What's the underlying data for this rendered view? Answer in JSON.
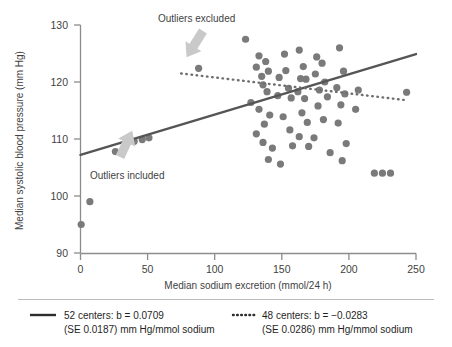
{
  "chart_data": {
    "type": "scatter",
    "title": "",
    "xlabel": "Median sodium excretion (mmol/24 h)",
    "ylabel": "Median systolic blood pressure (mm Hg)",
    "xlim": [
      0,
      250
    ],
    "ylim": [
      90,
      130
    ],
    "xticks": [
      0,
      50,
      100,
      150,
      200,
      250
    ],
    "yticks": [
      90,
      100,
      110,
      120,
      130
    ],
    "xtick_labels": [
      "0",
      "50",
      "100",
      "150",
      "200",
      "250"
    ],
    "ytick_labels": [
      "90",
      "100",
      "110",
      "120",
      "130"
    ],
    "grid": false,
    "legend_position": "below-plot",
    "point_color": "#7a7a7a",
    "annotations": [
      {
        "name": "outliers-excluded",
        "text": "Outliers excluded",
        "x": 100,
        "y": 129.4,
        "arrow_to_x": 88,
        "arrow_to_y": 121.8
      },
      {
        "name": "outliers-included",
        "text": "Outliers included",
        "x": 55,
        "y": 102.6,
        "arrow_to_x": 40,
        "arrow_to_y": 109.2
      }
    ],
    "points": [
      [
        0.5,
        95.0
      ],
      [
        7.0,
        99.0
      ],
      [
        26.0,
        107.8
      ],
      [
        40.0,
        109.6
      ],
      [
        46.0,
        109.9
      ],
      [
        51.0,
        110.2
      ],
      [
        88.0,
        122.4
      ],
      [
        123.0,
        127.5
      ],
      [
        133.0,
        124.6
      ],
      [
        131.0,
        122.6
      ],
      [
        135.0,
        121.0
      ],
      [
        138.0,
        123.6
      ],
      [
        140.0,
        121.9
      ],
      [
        136.0,
        119.5
      ],
      [
        139.0,
        118.3
      ],
      [
        127.0,
        116.4
      ],
      [
        133.0,
        115.2
      ],
      [
        141.0,
        114.2
      ],
      [
        137.0,
        112.6
      ],
      [
        131.0,
        110.9
      ],
      [
        136.0,
        109.4
      ],
      [
        143.0,
        108.4
      ],
      [
        140.0,
        106.4
      ],
      [
        147.0,
        117.6
      ],
      [
        148.0,
        120.8
      ],
      [
        152.0,
        124.9
      ],
      [
        153.0,
        122.0
      ],
      [
        155.0,
        118.9
      ],
      [
        157.0,
        117.2
      ],
      [
        151.0,
        113.9
      ],
      [
        156.0,
        111.6
      ],
      [
        158.0,
        108.8
      ],
      [
        149.0,
        105.6
      ],
      [
        163.0,
        125.6
      ],
      [
        166.0,
        122.7
      ],
      [
        164.0,
        120.6
      ],
      [
        168.0,
        120.5
      ],
      [
        162.0,
        118.3
      ],
      [
        167.0,
        117.1
      ],
      [
        165.0,
        114.6
      ],
      [
        169.0,
        112.9
      ],
      [
        163.0,
        110.4
      ],
      [
        170.0,
        108.7
      ],
      [
        176.0,
        124.4
      ],
      [
        180.0,
        123.3
      ],
      [
        175.0,
        121.4
      ],
      [
        182.0,
        120.0
      ],
      [
        178.0,
        118.6
      ],
      [
        184.0,
        117.4
      ],
      [
        177.0,
        115.8
      ],
      [
        181.0,
        113.4
      ],
      [
        174.0,
        110.2
      ],
      [
        186.0,
        107.6
      ],
      [
        193.0,
        126.0
      ],
      [
        196.0,
        121.9
      ],
      [
        191.0,
        119.0
      ],
      [
        197.0,
        117.9
      ],
      [
        194.0,
        116.0
      ],
      [
        192.0,
        112.8
      ],
      [
        198.0,
        109.2
      ],
      [
        195.0,
        106.2
      ],
      [
        207.0,
        118.6
      ],
      [
        205.0,
        115.2
      ],
      [
        219.0,
        104.0
      ],
      [
        225.0,
        104.0
      ],
      [
        231.0,
        104.0
      ],
      [
        243.0,
        118.2
      ]
    ],
    "series": [
      {
        "name": "52 centers",
        "style": "solid",
        "slope": 0.0709,
        "slope_se": 0.0187,
        "units": "mm Hg/mmol sodium",
        "line_x": [
          0,
          250
        ],
        "line_y": [
          107.2,
          124.9
        ]
      },
      {
        "name": "48 centers",
        "style": "dotted",
        "slope": -0.0283,
        "slope_se": 0.0286,
        "units": "mm Hg/mmol sodium",
        "line_x": [
          75,
          243
        ],
        "line_y": [
          121.5,
          116.8
        ]
      }
    ]
  },
  "legend": {
    "entries": [
      {
        "swatch": "solid-line",
        "line1": "52 centers: b = 0.0709",
        "line2": "(SE 0.0187) mm Hg/mmol sodium"
      },
      {
        "swatch": "dotted-line",
        "line1": "48 centers: b = −0.0283",
        "line2": "(SE 0.0286) mm Hg/mmol sodium"
      }
    ]
  }
}
